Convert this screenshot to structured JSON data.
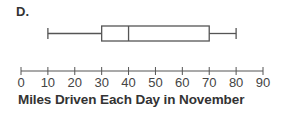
{
  "panel_label": "D.",
  "chart_data": {
    "type": "boxplot",
    "title": "",
    "xlabel": "Miles Driven Each Day in November",
    "ylabel": "",
    "xlim": [
      0,
      90
    ],
    "ticks": [
      0,
      10,
      20,
      30,
      40,
      50,
      60,
      70,
      80,
      90
    ],
    "tick_labels": [
      "0",
      "10",
      "20",
      "30",
      "40",
      "50",
      "60",
      "70",
      "80",
      "90"
    ],
    "box": {
      "min": 10,
      "q1": 30,
      "median": 40,
      "q3": 70,
      "max": 80
    },
    "grid": false,
    "legend": null
  },
  "colors": {
    "stroke": "#555555",
    "text": "#333333"
  }
}
